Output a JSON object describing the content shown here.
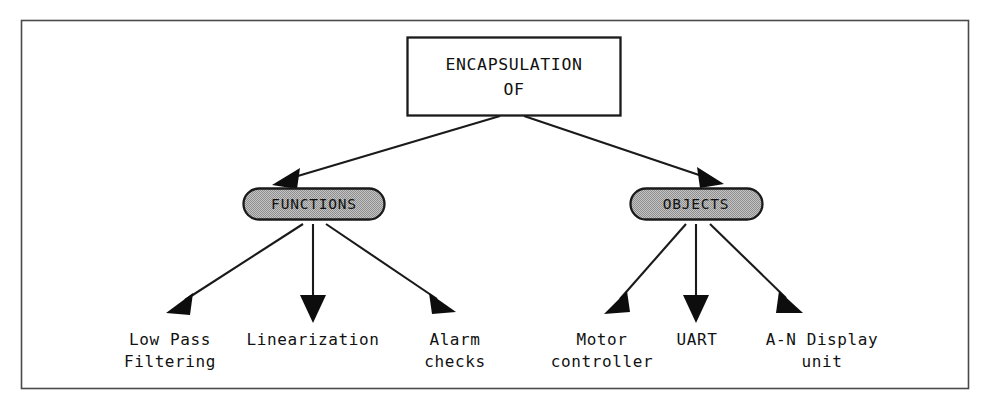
{
  "figure": {
    "frame": {
      "border_color": "#4a4a4a",
      "background": "#ffffff"
    },
    "root": {
      "label_line1": "ENCAPSULATION",
      "label_line2": "OF",
      "shape": "rectangle",
      "fill": "#ffffff",
      "stroke": "#1a1a1a"
    },
    "branches": [
      {
        "id": "functions",
        "label": "FUNCTIONS",
        "shape": "stadium",
        "fill": "#b3b3b3",
        "stroke": "#1a1a1a",
        "leaves": [
          {
            "id": "low-pass-filtering",
            "line1": "Low Pass",
            "line2": "Filtering"
          },
          {
            "id": "linearization",
            "line1": "Linearization",
            "line2": ""
          },
          {
            "id": "alarm-checks",
            "line1": "Alarm",
            "line2": "checks"
          }
        ]
      },
      {
        "id": "objects",
        "label": "OBJECTS",
        "shape": "stadium",
        "fill": "#b3b3b3",
        "stroke": "#1a1a1a",
        "leaves": [
          {
            "id": "motor-controller",
            "line1": "Motor",
            "line2": "controller"
          },
          {
            "id": "uart",
            "line1": "UART",
            "line2": ""
          },
          {
            "id": "a-n-display-unit",
            "line1": "A-N Display",
            "line2": "unit"
          }
        ]
      }
    ],
    "connector": {
      "line_color": "#1a1a1a",
      "arrowhead": "solid-triangle"
    }
  }
}
